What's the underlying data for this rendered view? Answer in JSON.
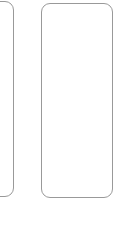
{
  "canvas": {
    "background_color": "#ffffff",
    "outline_color": "#999999"
  },
  "cards": [
    {
      "id": "card-left-partial",
      "state": "empty",
      "clipped": "left-edge",
      "fill_color": "#ffffff"
    },
    {
      "id": "card-right",
      "state": "empty",
      "clipped": "none",
      "fill_color": "#ffffff"
    }
  ]
}
